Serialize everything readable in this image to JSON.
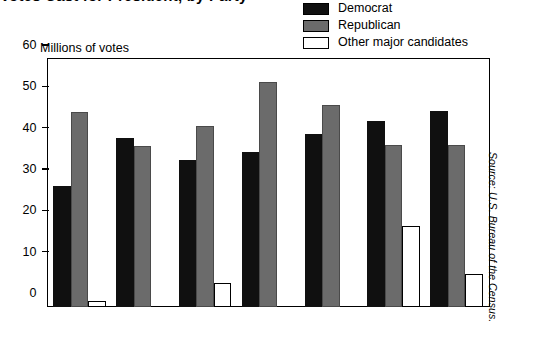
{
  "title": "Votes Cast for President, by Party",
  "legend": {
    "position": "top-right",
    "items": [
      {
        "label": "Democrat",
        "color": "#101010",
        "key": "democrat"
      },
      {
        "label": "Republican",
        "color": "#6b6b6b",
        "key": "republican"
      },
      {
        "label": "Other major candidates",
        "color": "#ffffff",
        "key": "other"
      }
    ]
  },
  "axis": {
    "y_caption": "Millions of votes",
    "y_ticks": [
      "0",
      "10",
      "20",
      "30",
      "40",
      "50",
      "60"
    ]
  },
  "source": "Source: U.S. Bureau of the Census.",
  "chart_data": {
    "type": "bar",
    "title": "Votes Cast for President, by Party",
    "xlabel": "",
    "ylabel": "Millions of votes",
    "ylim": [
      0,
      60
    ],
    "ytick_step": 10,
    "grid": false,
    "legend_position": "top-right",
    "categories": [
      "1972",
      "1976",
      "1980",
      "1984",
      "1988",
      "1992",
      "1996"
    ],
    "series": [
      {
        "name": "Democrat",
        "color": "#101010",
        "values": [
          29.2,
          40.8,
          35.5,
          37.6,
          41.8,
          44.9,
          47.4
        ]
      },
      {
        "name": "Republican",
        "color": "#6b6b6b",
        "values": [
          47.2,
          39.0,
          43.9,
          54.5,
          48.9,
          39.1,
          39.2
        ]
      },
      {
        "name": "Other major candidates",
        "color": "#ffffff",
        "values": [
          1.4,
          0.0,
          5.7,
          0.0,
          0.0,
          19.7,
          8.1
        ]
      }
    ]
  }
}
